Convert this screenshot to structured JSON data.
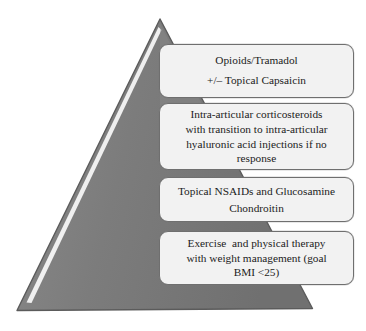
{
  "diagram": {
    "type": "pyramid",
    "title": "",
    "shape_name": "treatment-pyramid",
    "colors": {
      "pyramid_fill": "#7d7d7d",
      "pyramid_outline": "#595959",
      "pyramid_highlight": "#f5f5f5",
      "box_fill": "#f2f2f2",
      "box_border": "#6f6f6f",
      "text": "#1c1c1c",
      "background": "#ffffff"
    },
    "tiers": [
      {
        "id": "tier-1",
        "name": "opioids-tramadol-tier",
        "position": "top",
        "lines": [
          "Opioids/Tramadol",
          "+/– Topical Capsaicin"
        ]
      },
      {
        "id": "tier-2",
        "name": "intra-articular-injections-tier",
        "position": "upper-middle",
        "lines": [
          "Intra-articular corticosteroids",
          "with transition to intra-articular",
          "hyaluronic acid injections if no",
          "response"
        ]
      },
      {
        "id": "tier-3",
        "name": "topical-nsaids-glucosamine-tier",
        "position": "lower-middle",
        "lines": [
          "Topical NSAIDs and Glucosamine",
          "Chondroitin"
        ]
      },
      {
        "id": "tier-4",
        "name": "exercise-weight-management-tier",
        "position": "base",
        "lines": [
          "Exercise  and physical therapy",
          "with weight management (goal",
          "BMI <25)"
        ]
      }
    ]
  }
}
